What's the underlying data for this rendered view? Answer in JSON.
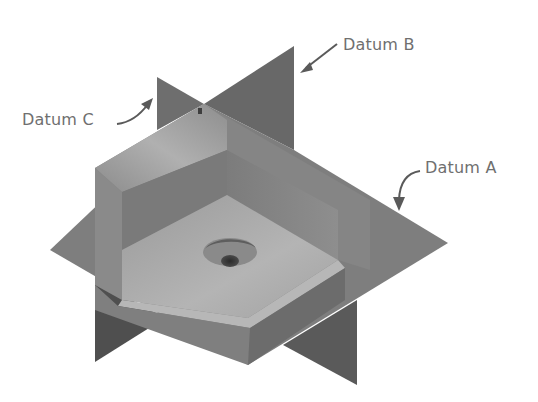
{
  "figure": {
    "labels": [
      {
        "id": "datum-a",
        "text": "Datum A",
        "target": "horizontal-plane"
      },
      {
        "id": "datum-b",
        "text": "Datum B",
        "target": "back-vertical-plane"
      },
      {
        "id": "datum-c",
        "text": "Datum C",
        "target": "side-vertical-plane"
      }
    ],
    "colors": {
      "background": "#ffffff",
      "label_text": "#6f6f6f",
      "arrow": "#5a5a5a",
      "plane_dark": "#5c5c5c",
      "plane_mid": "#7a7a7a",
      "part_light": "#a9a9a9",
      "part_mid": "#8c8c8c",
      "part_dark": "#6a6a6a"
    }
  }
}
